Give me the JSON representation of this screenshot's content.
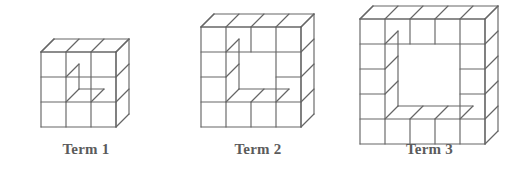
{
  "figure": {
    "background_color": "#ffffff",
    "line_color": "#666666",
    "label_color": "#5b5b5b",
    "terms": [
      {
        "label": "Term 1",
        "grid_size": 3,
        "hole_size": 1,
        "cube_count": 8,
        "origin_x": 10,
        "origin_y": 18,
        "cell": 25,
        "depth": 13,
        "label_top": 141
      },
      {
        "label": "Term 2",
        "grid_size": 4,
        "hole_size": 2,
        "cube_count": 12,
        "origin_x": 184,
        "origin_y": 18,
        "cell": 25,
        "depth": 13,
        "label_top": 141
      },
      {
        "label": "Term 3",
        "grid_size": 5,
        "hole_size": 3,
        "cube_count": 16,
        "origin_x": 358,
        "origin_y": 18,
        "cell": 25,
        "depth": 13,
        "label_top": 141
      }
    ]
  },
  "chart_data": {
    "type": "diagram",
    "categories": [
      "Term 1",
      "Term 2",
      "Term 3"
    ],
    "values": [
      8,
      12,
      16
    ],
    "series": [
      {
        "name": "Outer grid side (cubes)",
        "values": [
          3,
          4,
          5
        ]
      },
      {
        "name": "Inner hole side (cubes)",
        "values": [
          1,
          2,
          3
        ]
      },
      {
        "name": "Cubes in frame",
        "values": [
          8,
          12,
          16
        ]
      }
    ],
    "xlabel": "Term",
    "ylabel": "Number of cubes"
  }
}
